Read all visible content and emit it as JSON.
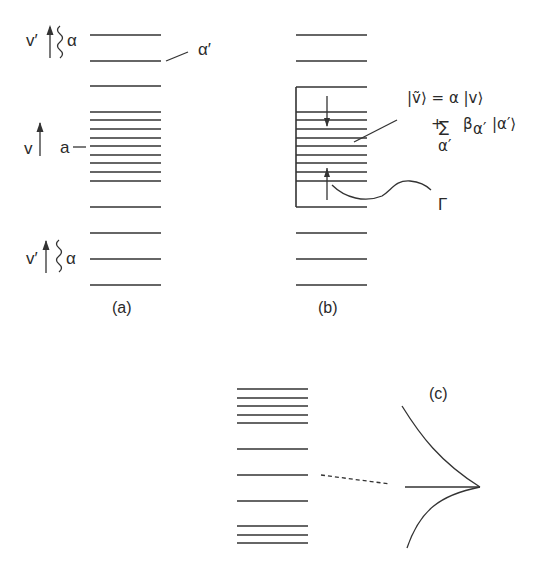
{
  "panels": {
    "a": {
      "caption": "(a)",
      "levels_y": [
        35,
        61,
        86,
        112,
        120,
        129,
        138,
        146,
        155,
        163,
        172,
        181,
        207,
        233,
        259,
        285
      ],
      "labels": {
        "top_vprime": "v′",
        "top_alpha": "α",
        "alpha_prime": "α′",
        "mid_v": "v",
        "mid_a": "a",
        "bot_vprime": "v′",
        "bot_alpha": "α"
      }
    },
    "b": {
      "caption": "(b)",
      "levels_y": [
        35,
        61,
        87,
        112,
        120,
        129,
        138,
        146,
        155,
        163,
        172,
        181,
        207,
        233,
        259,
        285
      ],
      "equation_line1": "|ṽ⟩ = α |v⟩",
      "equation_plus": "+",
      "equation_sum": "∑",
      "equation_sum_index": "α′",
      "equation_term": "β",
      "equation_term_sub": "α′",
      "equation_ket": "|α′⟩",
      "gamma_label": "Γ"
    },
    "c": {
      "caption": "(c)",
      "levels_y": [
        389,
        398,
        406,
        415,
        423,
        449,
        475,
        501,
        526,
        535,
        543
      ]
    }
  }
}
